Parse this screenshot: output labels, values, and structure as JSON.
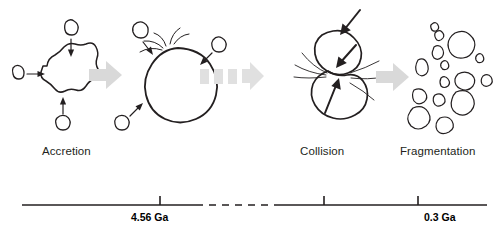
{
  "figure": {
    "background": "#ffffff",
    "ink": "#231f20",
    "arrow_fill": "#d9d9d9",
    "title": ""
  },
  "stages": [
    {
      "id": "accretion",
      "label": "Accretion",
      "label_x": 42,
      "label_y": 145,
      "description": "Small bodies converging onto an irregular central body",
      "incoming_bodies": 3
    },
    {
      "id": "melting",
      "label": "",
      "description": "Large rounded differentiated body with impact ejecta splash",
      "incoming_bodies": 3
    },
    {
      "id": "collision",
      "label": "Collision",
      "label_x": 300,
      "label_y": 145,
      "description": "Two bodies colliding with ejecta spray lines",
      "impact_arrows": 2
    },
    {
      "id": "fragmentation",
      "label": "Fragmentation",
      "label_x": 400,
      "label_y": 145,
      "description": "Field of scattered angular fragments",
      "fragment_count": 15
    }
  ],
  "connectors": [
    {
      "id": "connector-1",
      "style": "solid-block-arrow",
      "x": 89,
      "y": 80
    },
    {
      "id": "connector-2",
      "style": "dashed-block-arrow",
      "x": 200,
      "y": 74,
      "dash_segments": 3
    },
    {
      "id": "connector-3",
      "style": "solid-block-arrow",
      "x": 376,
      "y": 82
    }
  ],
  "timeline": {
    "axis_y": 205,
    "x_start": 22,
    "x_end": 487,
    "gap": {
      "x_start": 196,
      "x_end": 277,
      "style": "dashed"
    },
    "ticks": [
      {
        "id": "tick-456",
        "x": 160,
        "label": "4.56 Ga",
        "label_x": 131,
        "label_y": 211,
        "direction": "up"
      },
      {
        "id": "tick-collision",
        "x": 324,
        "label": "",
        "direction": "up"
      },
      {
        "id": "tick-03",
        "x": 418,
        "label": "0.3 Ga",
        "label_x": 424,
        "label_y": 211,
        "direction": "up"
      }
    ]
  }
}
